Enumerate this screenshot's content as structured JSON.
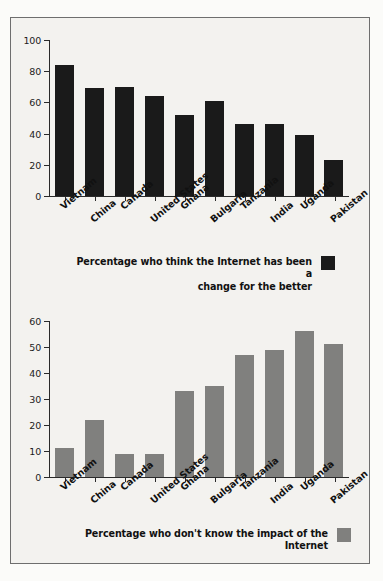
{
  "figure": {
    "background_color": "#f3f2ef",
    "border_color": "#6e6e6e"
  },
  "chart_data": [
    {
      "type": "bar",
      "title": "",
      "xlabel": "",
      "ylabel": "",
      "ylim": [
        0,
        100
      ],
      "yticks": [
        0,
        20,
        40,
        60,
        80,
        100
      ],
      "grid": false,
      "legend_position": "below-right",
      "series_name": "Percentage who think the Internet has been a change for the better",
      "bar_color": "#1a1a1a",
      "categories": [
        "Vietnam",
        "China",
        "Canada",
        "United States",
        "Ghana",
        "Bulgaria",
        "Tanzania",
        "India",
        "Uganda",
        "Pakistan"
      ],
      "values": [
        84,
        69,
        70,
        64,
        52,
        61,
        46,
        46,
        39,
        23
      ]
    },
    {
      "type": "bar",
      "title": "",
      "xlabel": "",
      "ylabel": "",
      "ylim": [
        0,
        60
      ],
      "yticks": [
        0,
        10,
        20,
        30,
        40,
        50,
        60
      ],
      "grid": false,
      "legend_position": "below-right",
      "series_name": "Percentage who don't know the impact of the Internet",
      "bar_color": "#80807e",
      "categories": [
        "Vietnam",
        "China",
        "Canada",
        "United States",
        "Ghana",
        "Bulgaria",
        "Tanzania",
        "India",
        "Uganda",
        "Pakistan"
      ],
      "values": [
        11,
        22,
        9,
        9,
        33,
        35,
        47,
        49,
        56,
        51
      ]
    }
  ],
  "legends": {
    "top_line1": "Percentage who think the Internet has been a",
    "top_line2": "change for the better",
    "bottom_line1": "Percentage who don't know the impact of the Internet"
  }
}
